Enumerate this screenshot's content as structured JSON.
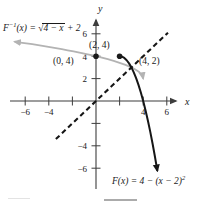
{
  "figure": {
    "background": "#ffffff",
    "axis_color": "#3d3d3d",
    "text_color": "#1a1a1a",
    "inverse_curve_color": "#b3b3b3",
    "function_curve_color": "#161616",
    "dash_pattern": "5 3.4"
  },
  "labels": {
    "inverse_formula": {
      "f": "F",
      "exp": "−1",
      "args": "(x)",
      "eq": " = ",
      "radical": "√",
      "radicand": "4 − x",
      "tail": " + 2"
    },
    "function_formula": {
      "lhs": "F(x)",
      "eq": " = ",
      "body": "4 − (x − 2)",
      "exp": "2"
    }
  },
  "chart_data": {
    "type": "line",
    "xlabel": "x",
    "ylabel": "y",
    "xlim": [
      -7.3,
      7.2
    ],
    "ylim": [
      -7.7,
      7.5
    ],
    "grid": false,
    "x_ticks": [
      {
        "value": -6,
        "label": "−6"
      },
      {
        "value": -4,
        "label": "−4"
      },
      {
        "value": -2,
        "label": ""
      },
      {
        "value": 2,
        "label": ""
      },
      {
        "value": 4,
        "label": "4"
      },
      {
        "value": 6,
        "label": "6"
      }
    ],
    "y_ticks": [
      {
        "value": 6,
        "label": "6"
      },
      {
        "value": 4,
        "label": "4"
      },
      {
        "value": 2,
        "label": "2"
      },
      {
        "value": -2,
        "label": ""
      },
      {
        "value": -4,
        "label": "−4"
      },
      {
        "value": -6,
        "label": "−6"
      }
    ],
    "series": [
      {
        "name": "F⁻¹(x) = √(4 − x) + 2",
        "kind": "inverse",
        "color": "#b3b3b3",
        "style": "solid",
        "arrow_start": true,
        "arrow_end": true,
        "points": [
          [
            -6.9,
            5.3
          ],
          [
            -6.4,
            5.22
          ],
          [
            -5.9,
            5.15
          ],
          [
            -5.4,
            5.07
          ],
          [
            -4.9,
            4.98
          ],
          [
            -4.4,
            4.9
          ],
          [
            -3.9,
            4.81
          ],
          [
            -3.4,
            4.72
          ],
          [
            -2.9,
            4.63
          ],
          [
            -2.4,
            4.53
          ],
          [
            -1.9,
            4.43
          ],
          [
            -1.4,
            4.32
          ],
          [
            -0.9,
            4.21
          ],
          [
            -0.4,
            4.1
          ],
          [
            0,
            4
          ],
          [
            0.5,
            3.87
          ],
          [
            1,
            3.73
          ],
          [
            1.5,
            3.58
          ],
          [
            2,
            3.41
          ],
          [
            2.5,
            3.22
          ],
          [
            3,
            3
          ],
          [
            3.3,
            2.84
          ],
          [
            3.6,
            2.63
          ],
          [
            3.8,
            2.45
          ],
          [
            3.9,
            2.32
          ],
          [
            3.97,
            2.17
          ],
          [
            4,
            2
          ]
        ]
      },
      {
        "name": "F(x) = 4 − (x − 2)²",
        "kind": "function",
        "color": "#161616",
        "style": "solid",
        "arrow_start": false,
        "arrow_end": true,
        "points": [
          [
            2,
            4
          ],
          [
            2.2,
            3.96
          ],
          [
            2.4,
            3.84
          ],
          [
            2.6,
            3.64
          ],
          [
            2.8,
            3.36
          ],
          [
            3,
            3
          ],
          [
            3.2,
            2.56
          ],
          [
            3.4,
            2.04
          ],
          [
            3.6,
            1.44
          ],
          [
            3.8,
            0.76
          ],
          [
            4,
            0
          ],
          [
            4.2,
            -0.84
          ],
          [
            4.4,
            -1.76
          ],
          [
            4.6,
            -2.76
          ],
          [
            4.8,
            -3.84
          ],
          [
            5,
            -5
          ],
          [
            5.2,
            -6.24
          ]
        ]
      },
      {
        "name": "y = x",
        "kind": "identity",
        "color": "#161616",
        "style": "dashed",
        "arrow_start": false,
        "arrow_end": false,
        "points": [
          [
            -3.4,
            -3.4
          ],
          [
            6.1,
            6.1
          ]
        ]
      }
    ],
    "marked_points": [
      {
        "x": 0,
        "y": 4
      },
      {
        "x": 2,
        "y": 4
      }
    ],
    "labeled_points": [
      {
        "x": 0,
        "y": 4,
        "label": "(0, 4)"
      },
      {
        "x": 2,
        "y": 4,
        "label": "(2, 4)"
      },
      {
        "x": 4,
        "y": 2,
        "label": "(4, 2)"
      }
    ]
  }
}
